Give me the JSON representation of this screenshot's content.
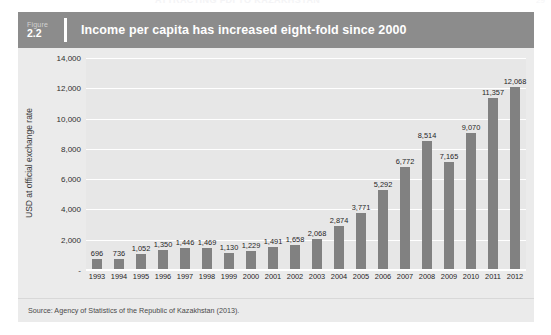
{
  "page": {
    "ghost_header_title": "ATTRACTING FDI TO KAZAKHSTAN",
    "ghost_page_number": "29"
  },
  "figure": {
    "figure_word": "Figure",
    "figure_number": "2.2",
    "title": "Income per capita has increased eight-fold since 2000",
    "source": "Source: Agency of Statistics of the Republic of Kazakhstan (2013)."
  },
  "colors": {
    "header_band": "#8c8c8c",
    "card_background": "#ebebeb",
    "plot_background": "#e7e7e7",
    "bar": "#818181",
    "gridline": "#ffffff",
    "title_text": "#ffffff"
  },
  "chart_data": {
    "type": "bar",
    "title": "Income per capita has increased eight-fold since 2000",
    "xlabel": "",
    "ylabel": "USD at official exchange rate",
    "ylim": [
      0,
      14000
    ],
    "ytick_labels": [
      "-",
      "2,000",
      "4,000",
      "6,000",
      "8,000",
      "10,000",
      "12,000",
      "14,000"
    ],
    "ytick_values": [
      0,
      2000,
      4000,
      6000,
      8000,
      10000,
      12000,
      14000
    ],
    "grid": true,
    "legend": false,
    "categories": [
      "1993",
      "1994",
      "1995",
      "1996",
      "1997",
      "1998",
      "1999",
      "2000",
      "2001",
      "2002",
      "2003",
      "2004",
      "2005",
      "2006",
      "2007",
      "2008",
      "2009",
      "2010",
      "2011",
      "2012"
    ],
    "values": [
      696,
      736,
      1052,
      1350,
      1446,
      1469,
      1130,
      1229,
      1491,
      1658,
      2068,
      2874,
      3771,
      5292,
      6772,
      8514,
      7165,
      9070,
      11357,
      12068
    ],
    "value_labels": [
      "696",
      "736",
      "1,052",
      "1,350",
      "1,446",
      "1,469",
      "1,130",
      "1,229",
      "1,491",
      "1,658",
      "2,068",
      "2,874",
      "3,771",
      "5,292",
      "6,772",
      "8,514",
      "7,165",
      "9,070",
      "11,357",
      "12,068"
    ]
  }
}
